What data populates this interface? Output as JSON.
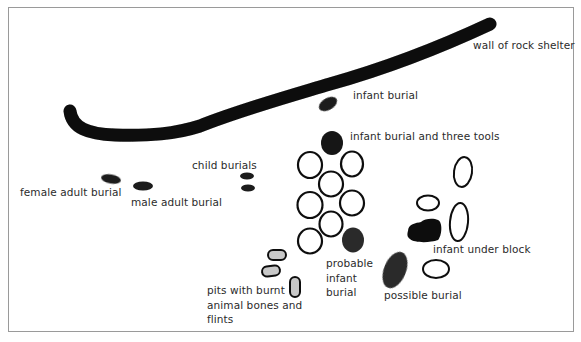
{
  "diagram": {
    "type": "archaeological site plan",
    "colors": {
      "wall": "#0a0a0a",
      "burial_fill": "#1a1a1a",
      "stone_outline": "#111111",
      "pit_fill": "#c8c8c8",
      "label_text": "#2b2b2b",
      "frame": "#9a9a9a"
    },
    "labels": {
      "wall": "wall of rock shelter",
      "infant_burial": "infant burial",
      "infant_burial_tools": "infant burial and three tools",
      "child_burials": "child burials",
      "female_adult": "female adult burial",
      "male_adult": "male adult burial",
      "probable_infant": "probable\ninfant\nburial",
      "infant_under_block": "infant under block",
      "possible_burial": "possible burial",
      "pits": "pits with burnt\nanimal bones and\nflints"
    }
  }
}
